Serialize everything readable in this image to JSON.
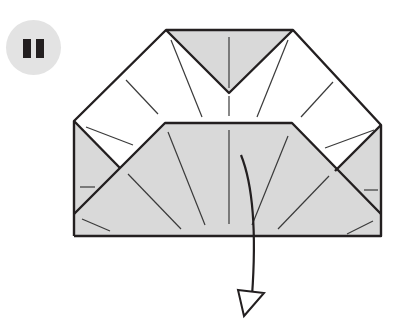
{
  "step": {
    "number": "11",
    "label": "Step 11"
  },
  "colors": {
    "paper_colored": "#d9d9d9",
    "paper_white": "#ffffff",
    "line": "#231f20",
    "crease": "#3a3a3a",
    "badge": "#e3e3e3"
  },
  "diagram": {
    "arrow": {
      "direction": "down",
      "type": "valley-fold-arrow"
    }
  }
}
